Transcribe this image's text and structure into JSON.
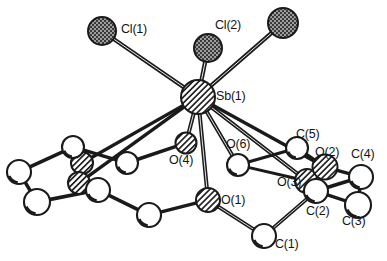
{
  "figure": {
    "type": "ortep-molecular-structure-diagram",
    "background_color": "#ffffff",
    "line_color": "#1a1a1a",
    "label_color": "#141414"
  },
  "atoms": [
    {
      "id": "cl1",
      "label": "Cl(1)",
      "element": "Cl",
      "style": "stippled",
      "cx": 102,
      "cy": 31,
      "r": 14,
      "label_x": 121,
      "label_y": 23
    },
    {
      "id": "cl2",
      "label": "Cl(2)",
      "element": "Cl",
      "style": "stippled",
      "cx": 208,
      "cy": 48,
      "r": 14,
      "label_x": 215,
      "label_y": 19
    },
    {
      "id": "cl3",
      "label": "",
      "element": "Cl",
      "style": "stippled",
      "cx": 283,
      "cy": 23,
      "r": 15,
      "label_x": 0,
      "label_y": 0
    },
    {
      "id": "sb1",
      "label": "Sb(1)",
      "element": "Sb",
      "style": "hatched",
      "cx": 198,
      "cy": 97,
      "r": 17,
      "label_x": 216,
      "label_y": 90
    },
    {
      "id": "o4",
      "label": "O(4)",
      "element": "O",
      "style": "hatched",
      "cx": 186,
      "cy": 143,
      "r": 10.5,
      "label_x": 169,
      "label_y": 154
    },
    {
      "id": "o6",
      "label": "O(6)",
      "element": "O",
      "style": "open",
      "cx": 238,
      "cy": 165,
      "r": 11,
      "label_x": 226,
      "label_y": 138
    },
    {
      "id": "o1",
      "label": "O(1)",
      "element": "O",
      "style": "hatched",
      "cx": 208,
      "cy": 200,
      "r": 12,
      "label_x": 221,
      "label_y": 194
    },
    {
      "id": "o3",
      "label": "O(3)",
      "element": "O",
      "style": "hatched",
      "cx": 307,
      "cy": 181,
      "r": 12,
      "label_x": 277,
      "label_y": 176
    },
    {
      "id": "o2",
      "label": "O(2)",
      "element": "O",
      "style": "hatched",
      "cx": 325,
      "cy": 167,
      "r": 12.5,
      "label_x": 315,
      "label_y": 146
    },
    {
      "id": "o5",
      "label": "",
      "element": "O",
      "style": "hatched",
      "cx": 82,
      "cy": 163,
      "r": 11,
      "label_x": 0,
      "label_y": 0
    },
    {
      "id": "o7",
      "label": "",
      "element": "O",
      "style": "hatched",
      "cx": 79,
      "cy": 183,
      "r": 11,
      "label_x": 0,
      "label_y": 0
    },
    {
      "id": "c1",
      "label": "C(1)",
      "element": "C",
      "style": "open",
      "cx": 264,
      "cy": 236,
      "r": 12,
      "label_x": 275,
      "label_y": 238
    },
    {
      "id": "c2",
      "label": "C(2)",
      "element": "C",
      "style": "open",
      "cx": 316,
      "cy": 191,
      "r": 12,
      "label_x": 306,
      "label_y": 205
    },
    {
      "id": "c3",
      "label": "C(3)",
      "element": "C",
      "style": "open",
      "cx": 358,
      "cy": 205,
      "r": 13,
      "label_x": 342,
      "label_y": 215
    },
    {
      "id": "c4",
      "label": "C(4)",
      "element": "C",
      "style": "open",
      "cx": 361,
      "cy": 177,
      "r": 12,
      "label_x": 351,
      "label_y": 148
    },
    {
      "id": "c5",
      "label": "C(5)",
      "element": "C",
      "style": "open",
      "cx": 297,
      "cy": 148,
      "r": 11,
      "label_x": 296,
      "label_y": 128
    },
    {
      "id": "cl",
      "label": "",
      "element": "C",
      "style": "open",
      "cx": 127,
      "cy": 163,
      "r": 11,
      "label_x": 0,
      "label_y": 0
    },
    {
      "id": "cx1",
      "label": "",
      "element": "C",
      "style": "open",
      "cx": 73,
      "cy": 147,
      "r": 11,
      "label_x": 0,
      "label_y": 0
    },
    {
      "id": "cx2",
      "label": "",
      "element": "C",
      "style": "open",
      "cx": 19,
      "cy": 172,
      "r": 12,
      "label_x": 0,
      "label_y": 0
    },
    {
      "id": "cx3",
      "label": "",
      "element": "C",
      "style": "open",
      "cx": 37,
      "cy": 202,
      "r": 13,
      "label_x": 0,
      "label_y": 0
    },
    {
      "id": "cx4",
      "label": "",
      "element": "C",
      "style": "open",
      "cx": 98,
      "cy": 190,
      "r": 12,
      "label_x": 0,
      "label_y": 0
    },
    {
      "id": "cx5",
      "label": "",
      "element": "C",
      "style": "open",
      "cx": 149,
      "cy": 215,
      "r": 12,
      "label_x": 0,
      "label_y": 0
    }
  ],
  "bonds": [
    {
      "from": "cl1",
      "to": "sb1",
      "width": 4.2
    },
    {
      "from": "cl2",
      "to": "sb1",
      "width": 4.2
    },
    {
      "from": "cl3",
      "to": "sb1",
      "width": 4.2
    },
    {
      "from": "sb1",
      "to": "o4",
      "width": 4.0
    },
    {
      "from": "sb1",
      "to": "o6",
      "width": 4.0
    },
    {
      "from": "sb1",
      "to": "o1",
      "width": 4.0
    },
    {
      "from": "sb1",
      "to": "o3",
      "width": 4.0
    },
    {
      "from": "sb1",
      "to": "o2",
      "width": 3.4
    },
    {
      "from": "sb1",
      "to": "o5",
      "width": 3.4
    },
    {
      "from": "sb1",
      "to": "o7",
      "width": 3.4
    },
    {
      "from": "o4",
      "to": "cl",
      "width": 3.6
    },
    {
      "from": "cl",
      "to": "cx1",
      "width": 3.4
    },
    {
      "from": "cx1",
      "to": "cx2",
      "width": 3.6
    },
    {
      "from": "cx2",
      "to": "cx3",
      "width": 3.6
    },
    {
      "from": "cx3",
      "to": "cx4",
      "width": 3.6
    },
    {
      "from": "cx4",
      "to": "o7",
      "width": 3.6
    },
    {
      "from": "o5",
      "to": "cx1",
      "width": 3.4
    },
    {
      "from": "cx4",
      "to": "cx5",
      "width": 3.6
    },
    {
      "from": "cx5",
      "to": "o1",
      "width": 3.6
    },
    {
      "from": "o1",
      "to": "c1",
      "width": 3.8
    },
    {
      "from": "c1",
      "to": "c2",
      "width": 3.8
    },
    {
      "from": "c2",
      "to": "o3",
      "width": 3.6
    },
    {
      "from": "c2",
      "to": "c4",
      "width": 3.6
    },
    {
      "from": "c4",
      "to": "c3",
      "width": 3.4
    },
    {
      "from": "c3",
      "to": "c2",
      "width": 3.4
    },
    {
      "from": "o2",
      "to": "c4",
      "width": 3.4
    },
    {
      "from": "o2",
      "to": "c5",
      "width": 3.4
    },
    {
      "from": "c5",
      "to": "o6",
      "width": 3.2
    },
    {
      "from": "o6",
      "to": "o3",
      "width": 3.0
    }
  ],
  "labels": {
    "cl1": "Cl(1)",
    "cl2": "Cl(2)",
    "sb1": "Sb(1)",
    "o1": "O(1)",
    "o2": "O(2)",
    "o3": "O(3)",
    "o4": "O(4)",
    "o6": "O(6)",
    "c1": "C(1)",
    "c2": "C(2)",
    "c3": "C(3)",
    "c4": "C(4)",
    "c5": "C(5)"
  }
}
